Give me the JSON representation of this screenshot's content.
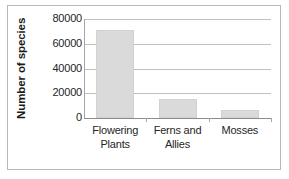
{
  "chart_data": {
    "type": "bar",
    "title": "",
    "subtitle": "",
    "xlabel": "",
    "ylabel": "Number of species",
    "categories": [
      "Flowering Plants",
      "Ferns and Allies",
      "Mosses"
    ],
    "category_lines": [
      [
        "Flowering",
        "Plants"
      ],
      [
        "Ferns and",
        "Allies"
      ],
      [
        "Mosses"
      ]
    ],
    "values": [
      71500,
      15000,
      6500
    ],
    "ylim": [
      0,
      80000
    ],
    "y_ticks": [
      0,
      20000,
      40000,
      60000,
      80000
    ],
    "y_tick_labels": [
      "0",
      "20000",
      "40000",
      "60000",
      "80000"
    ],
    "grid": "horizontal",
    "legend": "none",
    "bar_color": "#dadada",
    "gridline_color": "#bfbfbf",
    "axis_color": "#8c8c8c",
    "text_color": "#262626"
  },
  "figure": {
    "border_color": "#b8b8b8",
    "background": "#ffffff"
  }
}
